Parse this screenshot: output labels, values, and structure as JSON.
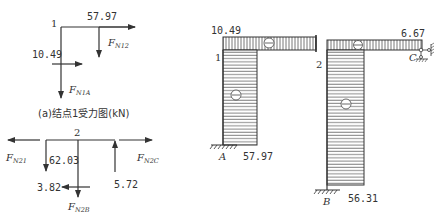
{
  "node1_diagram": {
    "node_label": "1",
    "force_top": "57.97",
    "force_left": "10.49",
    "F_N12": {
      "main": "F",
      "sub": "N12"
    },
    "F_N1A": {
      "main": "F",
      "sub": "N1A"
    },
    "caption": "(a)结点1受力图(kN)"
  },
  "node2_diagram": {
    "node_label": "2",
    "value_left_down": "62.03",
    "value_bottom_left": "3.82",
    "value_right_up": "5.72",
    "F_N21": {
      "main": "F",
      "sub": "N21"
    },
    "F_N2C": {
      "main": "F",
      "sub": "N2C"
    },
    "F_N2B": {
      "main": "F",
      "sub": "N2B"
    }
  },
  "axial_force_diagram": {
    "top_left_value": "10.49",
    "top_right_value": "6.67",
    "node_1": "1",
    "node_2": "2",
    "support_A": "A",
    "support_B": "B",
    "support_C": "C",
    "column_A_value": "57.97",
    "column_B_value": "56.31",
    "sign_symbol": "⊖"
  }
}
